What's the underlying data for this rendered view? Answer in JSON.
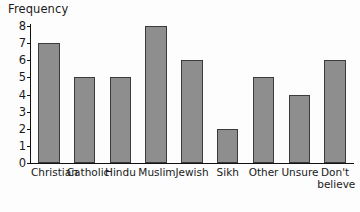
{
  "chart_data": {
    "type": "bar",
    "title": "",
    "xlabel": "",
    "ylabel": "Frequency",
    "categories": [
      "Christian",
      "Catholic",
      "Hindu",
      "Muslim",
      "Jewish",
      "Sikh",
      "Other",
      "Unsure",
      "Don't\nbelieve"
    ],
    "values": [
      7,
      5,
      5,
      8,
      6,
      2,
      5,
      4,
      6
    ],
    "ylim": [
      0,
      8
    ],
    "ytick_labels": [
      "0",
      "1",
      "2",
      "3",
      "4",
      "5",
      "6",
      "7",
      "8"
    ],
    "ytick_values": [
      0,
      1,
      2,
      3,
      4,
      5,
      6,
      7,
      8
    ],
    "grid": false,
    "legend": false,
    "bar_color": "#8e8e8e",
    "bar_edge_color": "#3b3b3b",
    "axis_color": "#111111"
  }
}
